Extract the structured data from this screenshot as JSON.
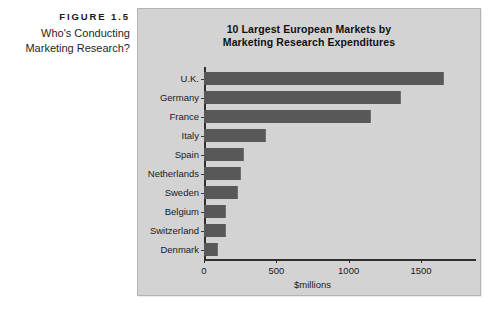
{
  "figure": {
    "number": "FIGURE 1.5",
    "caption_line1": "Who's Conducting",
    "caption_line2": "Marketing Research?"
  },
  "panel": {
    "background_color": "#d3d3d3",
    "bar_color": "#585858",
    "axis_color": "#2f2f2f"
  },
  "chart_data": {
    "type": "bar",
    "orientation": "horizontal",
    "title": "10 Largest European Markets by Marketing Research Expenditures",
    "title_line1": "10 Largest European Markets by",
    "title_line2": "Marketing Research Expenditures",
    "xlabel": "$millions",
    "ylabel": "",
    "xlim": [
      0,
      1750
    ],
    "xticks": [
      0,
      500,
      1000,
      1500
    ],
    "xtick_labels": [
      "0",
      "500",
      "1000",
      "1500"
    ],
    "grid": false,
    "legend": false,
    "categories": [
      "U.K.",
      "Germany",
      "France",
      "Italy",
      "Spain",
      "Netherlands",
      "Sweden",
      "Belgium",
      "Switzerland",
      "Denmark"
    ],
    "values": [
      1660,
      1360,
      1155,
      430,
      275,
      255,
      235,
      150,
      155,
      100
    ],
    "series": [
      {
        "name": "Marketing research expenditures",
        "values": [
          1660,
          1360,
          1155,
          430,
          275,
          255,
          235,
          150,
          155,
          100
        ]
      }
    ]
  }
}
